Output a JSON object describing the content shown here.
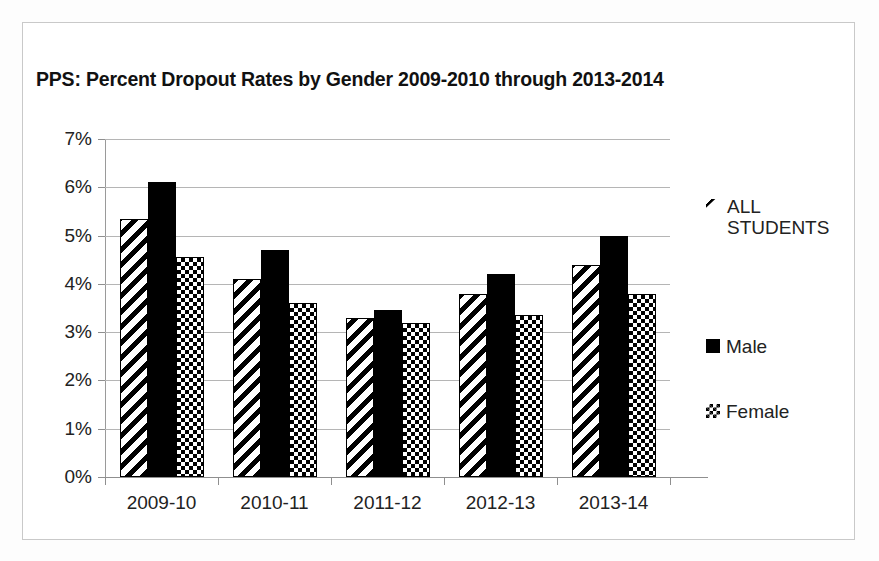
{
  "document": {
    "frame_border_color": "#c9c9c9",
    "background": "#ffffff"
  },
  "chart_data": {
    "type": "bar",
    "title": "PPS: Percent Dropout Rates by Gender 2009-2010 through 2013-2014",
    "xlabel": "",
    "ylabel": "",
    "categories": [
      "2009-10",
      "2010-11",
      "2011-12",
      "2012-13",
      "2013-14"
    ],
    "series": [
      {
        "name": "ALL STUDENTS",
        "pattern": "diagonal-hatch",
        "values": [
          5.35,
          4.1,
          3.3,
          3.8,
          4.4
        ]
      },
      {
        "name": "Male",
        "pattern": "solid-black",
        "values": [
          6.1,
          4.7,
          3.45,
          4.2,
          5.0
        ]
      },
      {
        "name": "Female",
        "pattern": "checkerboard",
        "values": [
          4.55,
          3.6,
          3.2,
          3.35,
          3.8
        ]
      }
    ],
    "ylim": [
      0,
      7
    ],
    "ytick_values": [
      0,
      1,
      2,
      3,
      4,
      5,
      6,
      7
    ],
    "ytick_labels": [
      "0%",
      "1%",
      "2%",
      "3%",
      "4%",
      "5%",
      "6%",
      "7%"
    ],
    "grid": true,
    "grid_axis": "y",
    "legend_position": "right",
    "legend_entries": [
      "ALL STUDENTS",
      "Male",
      "Female"
    ],
    "units": "percent"
  }
}
